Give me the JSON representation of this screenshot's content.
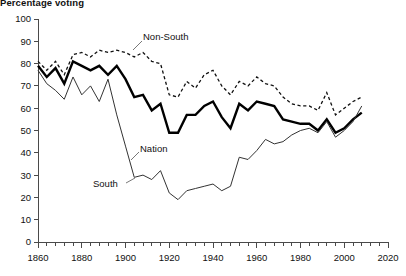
{
  "chart_data": {
    "type": "line",
    "title": "Percentage voting",
    "xlabel": "",
    "ylabel": "",
    "xlim": [
      1860,
      2020
    ],
    "ylim": [
      0,
      100
    ],
    "xticks_major": [
      1860,
      1880,
      1900,
      1920,
      1940,
      1960,
      1980,
      2000,
      2020
    ],
    "xtick_step_minor": 4,
    "yticks": [
      0,
      10,
      20,
      30,
      40,
      50,
      60,
      70,
      80,
      90,
      100
    ],
    "grid": false,
    "legend_position": "inline-annotations",
    "annotations": [
      {
        "text": "Non-South",
        "year": 1900,
        "value": 92
      },
      {
        "text": "Nation",
        "year": 1914,
        "value": 42
      },
      {
        "text": "South",
        "year": 1886,
        "value": 27
      }
    ],
    "series": [
      {
        "name": "Non-South",
        "style": "dashed",
        "x": [
          1860,
          1864,
          1868,
          1872,
          1876,
          1880,
          1884,
          1888,
          1892,
          1896,
          1900,
          1904,
          1908,
          1912,
          1916,
          1920,
          1924,
          1928,
          1932,
          1936,
          1940,
          1944,
          1948,
          1952,
          1956,
          1960,
          1964,
          1968,
          1972,
          1976,
          1980,
          1984,
          1988,
          1992,
          1996,
          2000,
          2004,
          2008
        ],
        "values": [
          81,
          77,
          81,
          75,
          84,
          85,
          83,
          86,
          85,
          86,
          85,
          83,
          85,
          81,
          80,
          66,
          65,
          72,
          69,
          75,
          77,
          70,
          66,
          72,
          70,
          74,
          71,
          70,
          65,
          62,
          61,
          61,
          59,
          67,
          57,
          60,
          63,
          65
        ]
      },
      {
        "name": "Nation",
        "style": "solid-thick",
        "x": [
          1860,
          1864,
          1868,
          1872,
          1876,
          1880,
          1884,
          1888,
          1892,
          1896,
          1900,
          1904,
          1908,
          1912,
          1916,
          1920,
          1924,
          1928,
          1932,
          1936,
          1940,
          1944,
          1948,
          1952,
          1956,
          1960,
          1964,
          1968,
          1972,
          1976,
          1980,
          1984,
          1988,
          1992,
          1996,
          2000,
          2004,
          2008
        ],
        "values": [
          79,
          74,
          78,
          71,
          81,
          79,
          77,
          79,
          75,
          79,
          73,
          65,
          66,
          59,
          62,
          49,
          49,
          57,
          57,
          61,
          63,
          56,
          51,
          62,
          59,
          63,
          62,
          61,
          55,
          54,
          53,
          53,
          50,
          55,
          49,
          51,
          55,
          58
        ]
      },
      {
        "name": "South",
        "style": "solid-thin",
        "x": [
          1860,
          1864,
          1868,
          1872,
          1876,
          1880,
          1884,
          1888,
          1892,
          1896,
          1900,
          1904,
          1908,
          1912,
          1916,
          1920,
          1924,
          1928,
          1932,
          1936,
          1940,
          1944,
          1948,
          1952,
          1956,
          1960,
          1964,
          1968,
          1972,
          1976,
          1980,
          1984,
          1988,
          1992,
          1996,
          2000,
          2004,
          2008
        ],
        "values": [
          77,
          71,
          68,
          64,
          74,
          66,
          70,
          63,
          73,
          57,
          43,
          29,
          30,
          28,
          32,
          22,
          19,
          23,
          24,
          25,
          26,
          23,
          25,
          38,
          37,
          41,
          46,
          44,
          45,
          48,
          50,
          51,
          49,
          54,
          47,
          50,
          54,
          61
        ]
      }
    ]
  },
  "axis": {
    "y_labels": [
      "0",
      "10",
      "20",
      "30",
      "40",
      "50",
      "60",
      "70",
      "80",
      "90",
      "100"
    ],
    "x_labels": [
      "1860",
      "1880",
      "1900",
      "1920",
      "1940",
      "1960",
      "1980",
      "2000",
      "2020"
    ]
  }
}
